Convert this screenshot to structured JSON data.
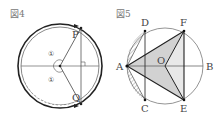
{
  "figures": [
    {
      "id": "fig4",
      "title": "図4",
      "labels": {
        "P": "P",
        "Q": "Q",
        "angle_top": "①",
        "angle_bottom": "①"
      },
      "colors": {
        "stroke": "#333333",
        "thin": "#555555"
      }
    },
    {
      "id": "fig5",
      "title": "図5",
      "labels": {
        "A": "A",
        "B": "B",
        "C": "C",
        "D": "D",
        "E": "E",
        "F": "F",
        "O": "O"
      },
      "colors": {
        "stroke": "#222222",
        "shade": "#c8c8c8",
        "circle": "#666666"
      }
    }
  ]
}
